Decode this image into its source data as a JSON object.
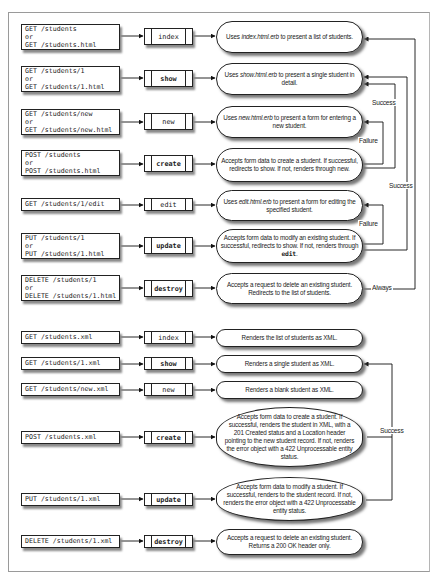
{
  "html_section": {
    "rows": [
      {
        "request": [
          "GET /students",
          "or",
          "GET /students.html"
        ],
        "action": "index",
        "action_bold": false,
        "description": [
          {
            "t": "Uses "
          },
          {
            "i": "index.html.erb"
          },
          {
            "t": " to present a list of students."
          }
        ]
      },
      {
        "request": [
          "GET /students/1",
          "or",
          "GET /students/1.html"
        ],
        "action": "show",
        "action_bold": true,
        "description": [
          {
            "t": "Uses "
          },
          {
            "i": "show.html.erb"
          },
          {
            "t": " to present a single student in detail."
          }
        ]
      },
      {
        "request": [
          "GET /students/new",
          "or",
          "GET /students/new.html"
        ],
        "action": "new",
        "action_bold": false,
        "description": [
          {
            "t": "Uses "
          },
          {
            "i": "new.html.erb"
          },
          {
            "t": " to present a form for entering a new student."
          }
        ]
      },
      {
        "request": [
          "POST /students",
          "or",
          "POST /students.html"
        ],
        "action": "create",
        "action_bold": true,
        "description": [
          {
            "t": "Accepts form data to create a student. If successful, redirects to show. If not, renders through new."
          }
        ]
      },
      {
        "request": [
          "GET /students/1/edit"
        ],
        "action": "edit",
        "action_bold": false,
        "description": [
          {
            "t": "Uses "
          },
          {
            "i": "edit.html.erb"
          },
          {
            "t": " to present a form for editing the specified student."
          }
        ]
      },
      {
        "request": [
          "PUT /students/1",
          "or",
          "PUT /students/1.html"
        ],
        "action": "update",
        "action_bold": true,
        "description": [
          {
            "t": "Accepts form data to modify an existing student. If successful, redirects to show. If not, renders through "
          },
          {
            "code": "edit"
          },
          {
            "t": "."
          }
        ]
      },
      {
        "request": [
          "DELETE /students/1",
          "or",
          "DELETE /students/1.html"
        ],
        "action": "destroy",
        "action_bold": true,
        "description": [
          {
            "t": "Accepts a request to delete an existing student. Redirects to the list of students."
          }
        ]
      }
    ],
    "flow_labels": {
      "success_create": "Success",
      "failure_create": "Failure",
      "success_update": "Success",
      "failure_update": "Failure",
      "always_destroy": "Always"
    }
  },
  "xml_section": {
    "rows": [
      {
        "request": [
          "GET /students.xml"
        ],
        "action": "index",
        "action_bold": false,
        "description": [
          {
            "t": "Renders the list of students as XML."
          }
        ]
      },
      {
        "request": [
          "GET /students/1.xml"
        ],
        "action": "show",
        "action_bold": true,
        "description": [
          {
            "t": "Renders a single student as XML."
          }
        ]
      },
      {
        "request": [
          "GET /students/new.xml"
        ],
        "action": "new",
        "action_bold": false,
        "description": [
          {
            "t": "Renders a blank student as XML."
          }
        ]
      },
      {
        "request": [
          "POST /students.xml"
        ],
        "action": "create",
        "action_bold": true,
        "description": [
          {
            "t": "Accepts form data to create a student. If successful, renders the student in XML, with a 201 Created status and a Location header pointing to the new student record. If not, renders the error object with a 422 Unprocessable entity status."
          }
        ]
      },
      {
        "request": [
          "PUT /students/1.xml"
        ],
        "action": "update",
        "action_bold": true,
        "description": [
          {
            "t": "Accepts form data to modify a student. If successful, renders to the student record. If not, renders the error object with a 422 Unprocessable entity status."
          }
        ]
      },
      {
        "request": [
          "DELETE /students/1.xml"
        ],
        "action": "destroy",
        "action_bold": true,
        "description": [
          {
            "t": "Accepts a request to delete an existing student. Returns a 200 OK header only."
          }
        ]
      }
    ],
    "flow_labels": {
      "success": "Success"
    }
  }
}
